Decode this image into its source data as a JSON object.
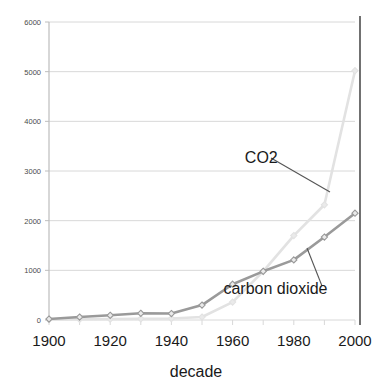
{
  "chart_data": {
    "type": "line",
    "title": "",
    "xlabel": "decade",
    "ylabel": "",
    "x": [
      1900,
      1910,
      1920,
      1930,
      1940,
      1950,
      1960,
      1970,
      1980,
      1990,
      2000
    ],
    "xlim": [
      1900,
      2000
    ],
    "ylim": [
      0,
      6000
    ],
    "xticks": [
      "1900",
      "1920",
      "1940",
      "1960",
      "1980",
      "2000"
    ],
    "yticks": [
      "0",
      "1000",
      "2000",
      "3000",
      "4000",
      "5000",
      "6000"
    ],
    "grid": true,
    "legend_position": "none",
    "series": [
      {
        "name": "CO2",
        "color": "#e2e2e2",
        "marker": "diamond",
        "values": [
          10,
          15,
          20,
          25,
          30,
          60,
          360,
          980,
          1700,
          2320,
          5020
        ]
      },
      {
        "name": "carbon dioxide",
        "color": "#9a9a9a",
        "marker": "diamond",
        "values": [
          20,
          60,
          95,
          135,
          130,
          300,
          720,
          980,
          1210,
          1670,
          2150
        ]
      }
    ],
    "annotations": [
      {
        "text": "CO2",
        "x": 1964,
        "y": 3160
      },
      {
        "text": "carbon dioxide",
        "x": 1957,
        "y": 530
      }
    ]
  },
  "axis": {
    "x_title": "decade",
    "y_ticks": [
      "6000",
      "5000",
      "4000",
      "3000",
      "2000",
      "1000",
      "0"
    ],
    "x_ticks": [
      "1900",
      "1920",
      "1940",
      "1960",
      "1980",
      "2000"
    ]
  },
  "labels": {
    "co2": "CO2",
    "carbon_dioxide": "carbon dioxide"
  },
  "colors": {
    "co2_line": "#e2e2e2",
    "carbon_dioxide_line": "#9a9a9a",
    "grid": "#d8d8d8",
    "axis": "#bdbdbd",
    "right_border": "#4d4d4d",
    "marker_fill": "#eaeaea",
    "text": "#1a1a1a"
  }
}
